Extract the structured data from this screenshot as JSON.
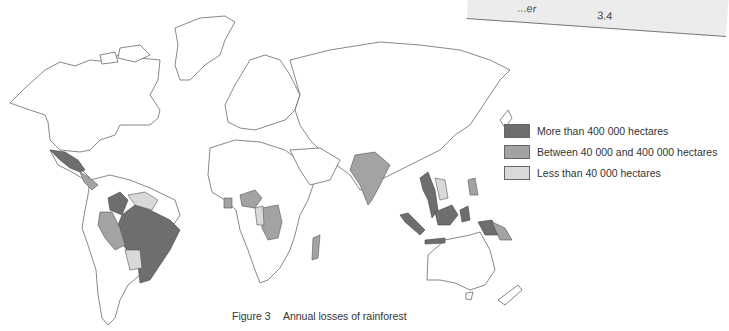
{
  "table_fragment": {
    "cell_label": "...er",
    "cell_value": "3.4"
  },
  "legend": {
    "items": [
      {
        "label": "More than 400 000 hectares",
        "color": "#6e6e6e"
      },
      {
        "label": "Between 40 000 and 400 000 hectares",
        "color": "#a3a3a3"
      },
      {
        "label": "Less than 40 000 hectares",
        "color": "#d9d9d9"
      }
    ]
  },
  "caption": {
    "number": "Figure 3",
    "title": "Annual losses of rainforest"
  },
  "map": {
    "more_than_400k": [
      "Mexico",
      "Colombia",
      "Brazil",
      "Myanmar",
      "Thailand",
      "Indonesia",
      "Malaysia"
    ],
    "between_40k_400k": [
      "Peru",
      "Ecuador",
      "India",
      "Nigeria",
      "Ivory Coast",
      "Zaire",
      "Madagascar",
      "Philippines",
      "Papua New Guinea",
      "Central America"
    ],
    "less_than_40k": [
      "Venezuela",
      "Guyana",
      "Bolivia",
      "Cameroon/Gabon",
      "Laos/Vietnam"
    ]
  }
}
